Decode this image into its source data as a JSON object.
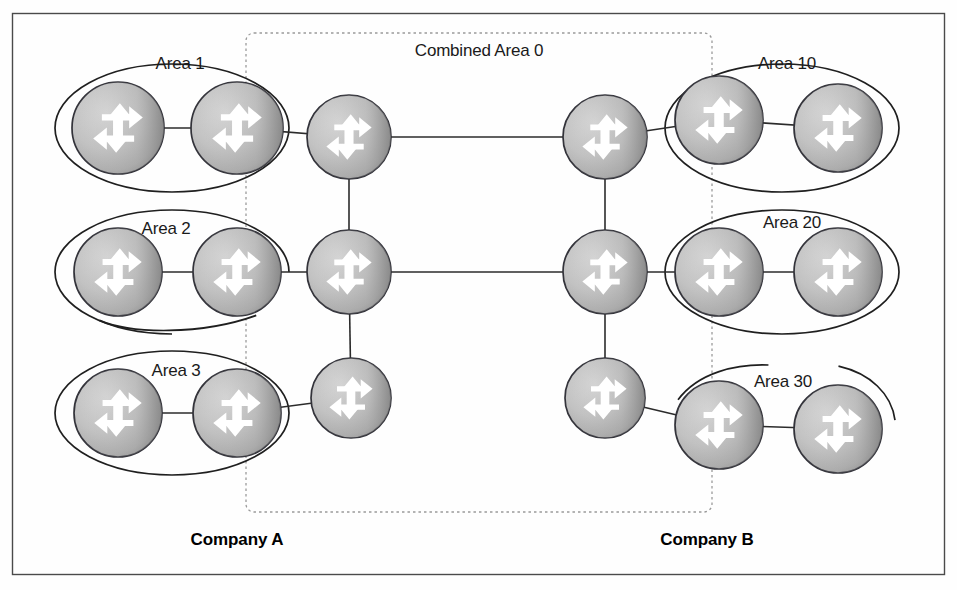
{
  "diagram": {
    "combined_area_label": "Combined Area 0",
    "frame": {
      "x": 12,
      "y": 13,
      "width": 933,
      "height": 562
    },
    "dashed_box": {
      "x": 246,
      "y": 33,
      "width": 466,
      "height": 479,
      "radius": 8
    },
    "combined_label_pos": {
      "x": 479,
      "y": 56
    },
    "colors": {
      "router_fill_light": "#cfcfcf",
      "router_fill_mid": "#b8b8b8",
      "router_fill_dark": "#9a9a9a",
      "router_stroke": "#33333a",
      "arrow": "#ffffff",
      "link": "#2b2b2b",
      "ellipse": "#1f1f1f",
      "dashed": "#9a9a9a",
      "frame": "#4a4a4a",
      "text": "#1a1a1a"
    }
  },
  "companies": [
    {
      "id": "company-a",
      "label": "Company A",
      "x": 237,
      "y": 545
    },
    {
      "id": "company-b",
      "label": "Company B",
      "x": 707,
      "y": 545
    }
  ],
  "areas": [
    {
      "id": "area-1",
      "label": "Area 1",
      "label_x": 180,
      "label_y": 69,
      "cx": 172,
      "cy": 128,
      "rx": 117,
      "ry": 64,
      "side": "A"
    },
    {
      "id": "area-2",
      "label": "Area 2",
      "label_x": 166,
      "label_y": 234,
      "cx": 172,
      "cy": 272,
      "rx": 117,
      "ry": 62,
      "side": "A",
      "broken": true
    },
    {
      "id": "area-3",
      "label": "Area 3",
      "label_x": 176,
      "label_y": 376,
      "cx": 172,
      "cy": 413,
      "rx": 117,
      "ry": 62,
      "side": "A"
    },
    {
      "id": "area-10",
      "label": "Area 10",
      "label_x": 787,
      "label_y": 69,
      "cx": 782,
      "cy": 128,
      "rx": 117,
      "ry": 64,
      "side": "B"
    },
    {
      "id": "area-20",
      "label": "Area 20",
      "label_x": 792,
      "label_y": 228,
      "cx": 782,
      "cy": 272,
      "rx": 117,
      "ry": 62,
      "side": "B"
    },
    {
      "id": "area-30",
      "label": "Area 30",
      "label_x": 783,
      "label_y": 387,
      "cx": 782,
      "cy": 425,
      "rx": 113,
      "ry": 60,
      "side": "B",
      "broken": true
    }
  ],
  "routers": [
    {
      "id": "r-a1-1",
      "area": "area-1",
      "cx": 118,
      "cy": 128,
      "r": 46,
      "role": "internal"
    },
    {
      "id": "r-a1-2",
      "area": "area-1",
      "cx": 237,
      "cy": 128,
      "r": 46,
      "role": "abr"
    },
    {
      "id": "r-a-bb1",
      "area": "combined-area-0",
      "cx": 349,
      "cy": 137,
      "r": 42,
      "role": "backbone"
    },
    {
      "id": "r-a2-1",
      "area": "area-2",
      "cx": 118,
      "cy": 272,
      "r": 44,
      "role": "internal"
    },
    {
      "id": "r-a2-2",
      "area": "area-2",
      "cx": 237,
      "cy": 272,
      "r": 44,
      "role": "abr"
    },
    {
      "id": "r-a-bb2",
      "area": "combined-area-0",
      "cx": 349,
      "cy": 272,
      "r": 42,
      "role": "backbone"
    },
    {
      "id": "r-a3-1",
      "area": "area-3",
      "cx": 118,
      "cy": 413,
      "r": 44,
      "role": "internal"
    },
    {
      "id": "r-a3-2",
      "area": "area-3",
      "cx": 237,
      "cy": 413,
      "r": 44,
      "role": "abr"
    },
    {
      "id": "r-a-bb3",
      "area": "combined-area-0",
      "cx": 351,
      "cy": 398,
      "r": 40,
      "role": "backbone"
    },
    {
      "id": "r-b-bb1",
      "area": "combined-area-0",
      "cx": 605,
      "cy": 137,
      "r": 42,
      "role": "backbone"
    },
    {
      "id": "r-b10-1",
      "area": "area-10",
      "cx": 719,
      "cy": 120,
      "r": 44,
      "role": "abr"
    },
    {
      "id": "r-b10-2",
      "area": "area-10",
      "cx": 838,
      "cy": 128,
      "r": 44,
      "role": "internal"
    },
    {
      "id": "r-b-bb2",
      "area": "combined-area-0",
      "cx": 605,
      "cy": 272,
      "r": 42,
      "role": "backbone"
    },
    {
      "id": "r-b20-1",
      "area": "area-20",
      "cx": 719,
      "cy": 272,
      "r": 44,
      "role": "abr"
    },
    {
      "id": "r-b20-2",
      "area": "area-20",
      "cx": 838,
      "cy": 272,
      "r": 44,
      "role": "internal"
    },
    {
      "id": "r-b-bb3",
      "area": "combined-area-0",
      "cx": 605,
      "cy": 398,
      "r": 40,
      "role": "backbone"
    },
    {
      "id": "r-b30-1",
      "area": "area-30",
      "cx": 719,
      "cy": 425,
      "r": 44,
      "role": "abr"
    },
    {
      "id": "r-b30-2",
      "area": "area-30",
      "cx": 838,
      "cy": 429,
      "r": 44,
      "role": "internal"
    }
  ],
  "links": [
    {
      "id": "l-a1",
      "from": "r-a1-1",
      "to": "r-a1-2"
    },
    {
      "id": "l-a2",
      "from": "r-a1-2",
      "to": "r-a-bb1"
    },
    {
      "id": "l-a3",
      "from": "r-a2-1",
      "to": "r-a2-2"
    },
    {
      "id": "l-a4",
      "from": "r-a2-2",
      "to": "r-a-bb2"
    },
    {
      "id": "l-a5",
      "from": "r-a3-1",
      "to": "r-a3-2"
    },
    {
      "id": "l-a6",
      "from": "r-a3-2",
      "to": "r-a-bb3"
    },
    {
      "id": "l-spine-a-12",
      "from": "r-a-bb1",
      "to": "r-a-bb2"
    },
    {
      "id": "l-spine-a-23",
      "from": "r-a-bb2",
      "to": "r-a-bb3"
    },
    {
      "id": "l-cross-top",
      "from": "r-a-bb1",
      "to": "r-b-bb1"
    },
    {
      "id": "l-cross-mid",
      "from": "r-a-bb2",
      "to": "r-b-bb2"
    },
    {
      "id": "l-spine-b-12",
      "from": "r-b-bb1",
      "to": "r-b-bb2"
    },
    {
      "id": "l-spine-b-23",
      "from": "r-b-bb2",
      "to": "r-b-bb3"
    },
    {
      "id": "l-b1",
      "from": "r-b-bb1",
      "to": "r-b10-1"
    },
    {
      "id": "l-b2",
      "from": "r-b10-1",
      "to": "r-b10-2"
    },
    {
      "id": "l-b3",
      "from": "r-b-bb2",
      "to": "r-b20-1"
    },
    {
      "id": "l-b4",
      "from": "r-b20-1",
      "to": "r-b20-2"
    },
    {
      "id": "l-b5",
      "from": "r-b-bb3",
      "to": "r-b30-1"
    },
    {
      "id": "l-b6",
      "from": "r-b30-1",
      "to": "r-b30-2"
    }
  ]
}
